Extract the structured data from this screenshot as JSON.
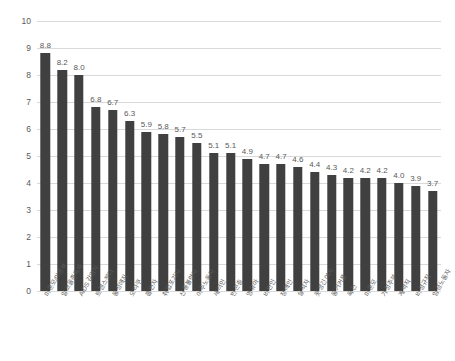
{
  "chart_data": {
    "type": "bar",
    "title": "",
    "subtitle": "",
    "xlabel": "",
    "ylabel": "",
    "ylim": [
      0,
      10
    ],
    "ytick_step": 1,
    "ytick_labels": [
      "10",
      "9",
      "8",
      "7",
      "6",
      "5",
      "4",
      "3",
      "2",
      "1",
      "0"
    ],
    "grid": true,
    "legend": "none",
    "orientation": "vertical",
    "bar_color": "#404040",
    "gridline_color": "#d9d9d9",
    "text_color": "#595959",
    "background": "#ffffff",
    "data_labels": true,
    "data_label_format": "0.0",
    "categories": [
      "미혼모/미혼부",
      "알코올중독자",
      "AIDS 감염자",
      "트렌스젠더",
      "동성애자",
      "오타쿠",
      "흡연자",
      "취업포기자",
      "신용불량자",
      "이주노동자",
      "새터민",
      "빈곤층",
      "영유아",
      "비만인",
      "장애인",
      "실직자",
      "못생긴 여자",
      "동거커플",
      "독신",
      "미혼모",
      "가정주부",
      "계약직",
      "비정규직",
      "임금노동자"
    ],
    "values": [
      8.8,
      8.2,
      8.0,
      6.8,
      6.7,
      6.3,
      5.9,
      5.8,
      5.7,
      5.5,
      5.1,
      5.1,
      4.9,
      4.7,
      4.7,
      4.6,
      4.4,
      4.3,
      4.2,
      4.2,
      4.2,
      4.0,
      3.9,
      3.7
    ],
    "value_labels": [
      "8.8",
      "8.2",
      "8.0",
      "6.8",
      "6.7",
      "6.3",
      "5.9",
      "5.8",
      "5.7",
      "5.5",
      "5.1",
      "5.1",
      "4.9",
      "4.7",
      "4.7",
      "4.6",
      "4.4",
      "4.3",
      "4.2",
      "4.2",
      "4.2",
      "4.0",
      "3.9",
      "3.7"
    ]
  }
}
